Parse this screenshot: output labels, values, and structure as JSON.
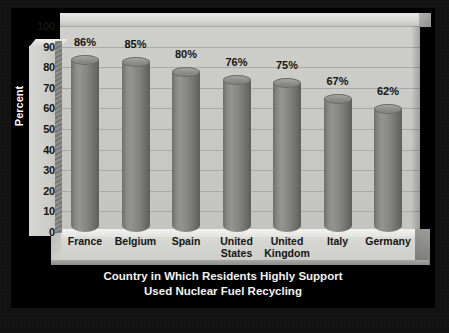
{
  "chart_data": {
    "type": "bar",
    "title": "Country in Which Residents Highly Support Used Nuclear Fuel Recycling",
    "title_line1": "Country in Which Residents Highly Support",
    "title_line2": "Used Nuclear Fuel Recycling",
    "xlabel": "",
    "ylabel": "Percent",
    "ylim": [
      0,
      100
    ],
    "ytick_step": 10,
    "grid": true,
    "legend": "none",
    "style": "3d-cylinder",
    "categories": [
      "France",
      "Belgium",
      "Spain",
      "United States",
      "United Kingdom",
      "Italy",
      "Germany"
    ],
    "values": [
      86,
      85,
      80,
      76,
      75,
      67,
      62
    ],
    "value_labels": [
      "86%",
      "85%",
      "80%",
      "76%",
      "75%",
      "67%",
      "62%"
    ],
    "yticks": [
      "100",
      "90",
      "80",
      "70",
      "60",
      "50",
      "40",
      "30",
      "20",
      "10",
      "0"
    ],
    "category_lines": [
      [
        "France"
      ],
      [
        "Belgium"
      ],
      [
        "Spain"
      ],
      [
        "United",
        "States"
      ],
      [
        "United",
        "Kingdom"
      ],
      [
        "Italy"
      ],
      [
        "Germany"
      ]
    ]
  },
  "colors": {
    "background": "#000000",
    "border": "#0d0d0d",
    "plot_wall": "#c9c9c6",
    "floor": "#d6d6d3",
    "bar": "#858582",
    "bar_highlight": "#949491",
    "bar_shadow": "#5e5e5b",
    "gridline": "#a9a9a6",
    "text_dark": "#15150f",
    "text_light": "#f2f2f2"
  }
}
